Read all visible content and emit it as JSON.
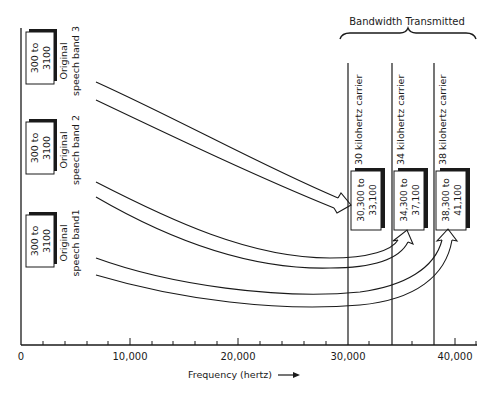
{
  "diagram": {
    "type": "frequency-division-multiplexing",
    "header": {
      "label": "Bandwidth Transmitted"
    },
    "x_axis": {
      "label": "Frequency (hertz)",
      "arrow": "→",
      "ticks": [
        "0",
        "10,000",
        "20,000",
        "30,000",
        "40,000"
      ],
      "range": [
        0,
        42000
      ]
    },
    "input_bands": [
      {
        "name": "Original speech band 3",
        "line1": "Original",
        "line2": "speech band 3",
        "range_top": "300 to",
        "range_bottom": "3100"
      },
      {
        "name": "Original speech band 2",
        "line1": "Original",
        "line2": "speech band 2",
        "range_top": "300 to",
        "range_bottom": "3100"
      },
      {
        "name": "Original speech band 1",
        "line1": "Original",
        "line2": "speech band1",
        "range_top": "300 to",
        "range_bottom": "3100"
      }
    ],
    "carriers": [
      {
        "label": "30 kilohertz carrier",
        "freq": 30000,
        "range_top": "30,300 to",
        "range_bottom": "33,100"
      },
      {
        "label": "34 kilohertz carrier",
        "freq": 34000,
        "range_top": "34,300 to",
        "range_bottom": "37,100"
      },
      {
        "label": "38 kilohertz carrier",
        "freq": 38000,
        "range_top": "38,300 to",
        "range_bottom": "41,100"
      }
    ],
    "colors": {
      "ink": "#1a1a1a",
      "background": "#ffffff"
    }
  }
}
